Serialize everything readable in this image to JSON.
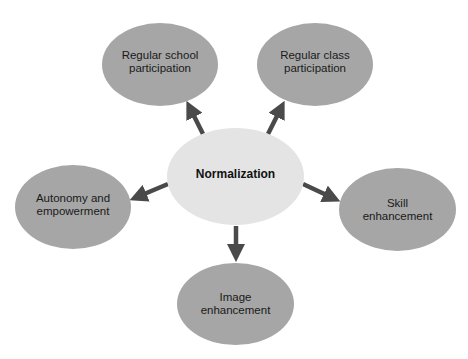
{
  "diagram": {
    "title": "Normalization",
    "colors": {
      "center_fill": "#e4e4e4",
      "outer_fill": "#a6a6a6",
      "arrow": "#4a4a4a",
      "background": "#ffffff"
    },
    "center": {
      "id": "normalization",
      "label": "Normalization"
    },
    "nodes": [
      {
        "id": "regular-school-participation",
        "label": "Regular school\nparticipation"
      },
      {
        "id": "regular-class-participation",
        "label": "Regular class\nparticipation"
      },
      {
        "id": "autonomy-and-empowerment",
        "label": "Autonomy and\nempowerment"
      },
      {
        "id": "skill-enhancement",
        "label": "Skill\nenhancement"
      },
      {
        "id": "image-enhancement",
        "label": "Image\nenhancement"
      }
    ],
    "edges": [
      {
        "from": "normalization",
        "to": "regular-school-participation"
      },
      {
        "from": "normalization",
        "to": "regular-class-participation"
      },
      {
        "from": "normalization",
        "to": "autonomy-and-empowerment"
      },
      {
        "from": "normalization",
        "to": "skill-enhancement"
      },
      {
        "from": "normalization",
        "to": "image-enhancement"
      }
    ]
  }
}
